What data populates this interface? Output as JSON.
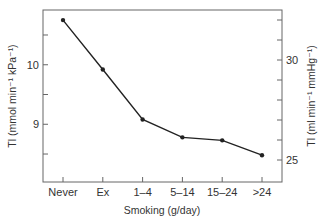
{
  "chart_data": {
    "type": "line",
    "title": "",
    "xlabel": "Smoking (g/day)",
    "ylabel": "Tl (mmol min⁻¹ kPa⁻¹)",
    "ylabel_right": "Tl (ml min⁻¹ mmHg⁻¹)",
    "categories": [
      "Never",
      "Ex",
      "1–4",
      "5–14",
      "15–24",
      ">24"
    ],
    "series": [
      {
        "name": "Tl",
        "values": [
          10.75,
          9.92,
          9.08,
          8.78,
          8.73,
          8.48
        ]
      }
    ],
    "ylim": [
      8.03,
      10.92
    ],
    "yticks": [
      8.5,
      9,
      9.5,
      10,
      10.5
    ],
    "ytick_labels": [
      "",
      "9",
      "",
      "10",
      ""
    ],
    "ylim_right": [
      23.9,
      32.5
    ],
    "yticks_right": [
      25,
      26,
      27,
      28,
      29,
      30,
      31,
      32
    ],
    "ytick_labels_right": [
      "25",
      "",
      "",
      "",
      "",
      "30",
      "",
      ""
    ],
    "grid": false,
    "legend": "none",
    "marker": "dot",
    "line_color": "#222222"
  }
}
